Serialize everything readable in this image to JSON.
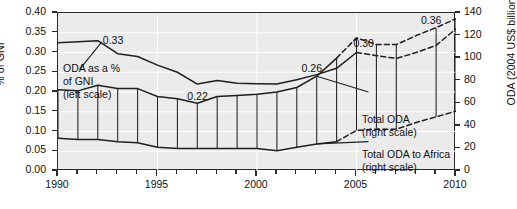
{
  "chart_data": {
    "type": "line",
    "title": "",
    "subtitle": "",
    "xlabel": "",
    "ylabel": "% of GNI",
    "ylabel_right": "ODA (2004 US$ billion)",
    "grid": true,
    "legend_position": "inline-annotations",
    "x": [
      1990,
      1991,
      1992,
      1993,
      1994,
      1995,
      1996,
      1997,
      1998,
      1999,
      2000,
      2001,
      2002,
      2003,
      2004,
      2005,
      2006,
      2007,
      2008,
      2009,
      2010
    ],
    "xlim": [
      1990,
      2010
    ],
    "xticks_major": [
      1990,
      1995,
      2000,
      2005,
      2010
    ],
    "xtick_labels": [
      "1990",
      "1995",
      "2000",
      "2005",
      "2010"
    ],
    "ylim_left": [
      0.0,
      0.4
    ],
    "yticks_left": [
      0.0,
      0.05,
      0.1,
      0.15,
      0.2,
      0.25,
      0.3,
      0.35,
      0.4
    ],
    "ytick_labels_left": [
      "0.00",
      "0.05",
      "0.10",
      "0.15",
      "0.20",
      "0.25",
      "0.30",
      "0.35",
      "0.40"
    ],
    "ylim_right": [
      0,
      140
    ],
    "yticks_right": [
      0,
      20,
      40,
      60,
      80,
      100,
      120,
      140
    ],
    "ytick_labels_right": [
      "0",
      "20",
      "40",
      "60",
      "80",
      "100",
      "120",
      "140"
    ],
    "series": [
      {
        "name": "ODA as a % of GNI",
        "axis": "left",
        "style": "solid",
        "values": [
          0.325,
          0.327,
          0.33,
          0.297,
          0.29,
          0.268,
          0.25,
          0.22,
          0.229,
          0.222,
          0.221,
          0.22,
          0.231,
          0.244,
          0.26,
          0.3,
          0.292,
          0.285,
          0.3,
          0.318,
          0.36
        ],
        "dashed_from": 2005
      },
      {
        "name": "Total ODA",
        "axis": "right",
        "style": "solid-then-dashed",
        "values": [
          72,
          71,
          76,
          73,
          73,
          66,
          64,
          60,
          66,
          67,
          68,
          70,
          74,
          84,
          100,
          118,
          112,
          112,
          120,
          127,
          135
        ],
        "dashed_from": 2004
      },
      {
        "name": "Total ODA to Africa",
        "axis": "right",
        "style": "solid-then-dashed",
        "values": [
          29,
          28,
          28,
          26,
          25,
          21,
          20,
          20,
          20,
          20,
          20,
          18,
          21,
          24,
          26,
          36,
          37,
          37,
          43,
          48,
          53
        ],
        "dashed_from": 2004
      }
    ],
    "annotations": [
      {
        "text": "0.33",
        "series": "ODA as a % of GNI",
        "x": 1992,
        "value": 0.33
      },
      {
        "text": "0.22",
        "series": "ODA as a % of GNI",
        "x": 1997,
        "value": 0.22
      },
      {
        "text": "0.26",
        "series": "ODA as a % of GNI",
        "x": 2004,
        "value": 0.26
      },
      {
        "text": "0.30",
        "series": "ODA as a % of GNI",
        "x": 2005,
        "value": 0.3
      },
      {
        "text": "0.36",
        "series": "ODA as a % of GNI",
        "x": 2010,
        "value": 0.36
      }
    ],
    "callouts": [
      {
        "name": "oda-pct-gni-callout",
        "line1": "ODA as a %",
        "line2": "of GNI",
        "line3": "(left scale)"
      },
      {
        "name": "total-oda-callout",
        "line1": "Total ODA",
        "line2": "(right scale)"
      },
      {
        "name": "total-oda-africa-callout",
        "line1": "Total ODA to Africa",
        "line2": "(right scale)"
      }
    ],
    "colors": {
      "plot_background": "#ebebeb",
      "grid": "#ffffff",
      "axis": "#2a2a2a",
      "line": "#1f1f1f",
      "text": "#111111"
    }
  }
}
